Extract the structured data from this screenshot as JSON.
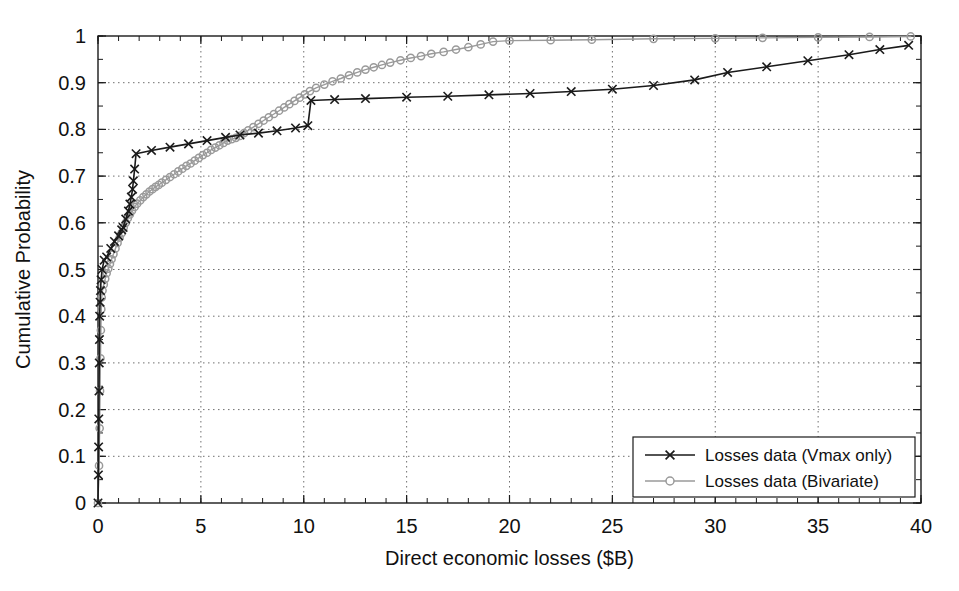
{
  "chart_data": {
    "type": "line",
    "title": "",
    "xlabel": "Direct economic losses ($B)",
    "ylabel": "Cumulative Probability",
    "xlim": [
      0,
      40
    ],
    "ylim": [
      0,
      1
    ],
    "xticks": [
      0,
      5,
      10,
      15,
      20,
      25,
      30,
      35,
      40
    ],
    "xticklabels": [
      "0",
      "5",
      "10",
      "15",
      "20",
      "25",
      "30",
      "35",
      "40"
    ],
    "yticks": [
      0,
      0.1,
      0.2,
      0.3,
      0.4,
      0.5,
      0.6,
      0.7,
      0.8,
      0.9,
      1
    ],
    "yticklabels": [
      "0",
      "0.1",
      "0.2",
      "0.3",
      "0.4",
      "0.5",
      "0.6",
      "0.7",
      "0.8",
      "0.9",
      "1"
    ],
    "xminor_step": 1,
    "yminor_step": 0.05,
    "grid": true,
    "grid_style": "dotted",
    "legend_position": "lower right",
    "series": [
      {
        "name": "Losses data (Vmax only)",
        "color": "#1a1a1a",
        "marker": "x",
        "marker_color": "#1a1a1a",
        "points": [
          [
            0.0,
            0.0
          ],
          [
            0.02,
            0.06
          ],
          [
            0.03,
            0.12
          ],
          [
            0.04,
            0.18
          ],
          [
            0.05,
            0.24
          ],
          [
            0.06,
            0.3
          ],
          [
            0.07,
            0.35
          ],
          [
            0.08,
            0.4
          ],
          [
            0.1,
            0.43
          ],
          [
            0.12,
            0.455
          ],
          [
            0.15,
            0.478
          ],
          [
            0.2,
            0.5
          ],
          [
            0.3,
            0.52
          ],
          [
            0.42,
            0.527
          ],
          [
            0.62,
            0.545
          ],
          [
            0.8,
            0.56
          ],
          [
            1.0,
            0.572
          ],
          [
            1.15,
            0.585
          ],
          [
            1.22,
            0.59
          ],
          [
            1.35,
            0.608
          ],
          [
            1.48,
            0.625
          ],
          [
            1.55,
            0.64
          ],
          [
            1.62,
            0.655
          ],
          [
            1.68,
            0.672
          ],
          [
            1.72,
            0.69
          ],
          [
            1.78,
            0.715
          ],
          [
            1.85,
            0.748
          ],
          [
            2.6,
            0.755
          ],
          [
            3.5,
            0.762
          ],
          [
            4.4,
            0.769
          ],
          [
            5.3,
            0.776
          ],
          [
            6.2,
            0.783
          ],
          [
            6.9,
            0.788
          ],
          [
            7.8,
            0.792
          ],
          [
            8.7,
            0.797
          ],
          [
            9.6,
            0.803
          ],
          [
            10.2,
            0.808
          ],
          [
            10.35,
            0.862
          ],
          [
            11.5,
            0.864
          ],
          [
            13.0,
            0.866
          ],
          [
            15.0,
            0.869
          ],
          [
            17.0,
            0.871
          ],
          [
            19.0,
            0.874
          ],
          [
            21.0,
            0.877
          ],
          [
            23.0,
            0.881
          ],
          [
            25.0,
            0.886
          ],
          [
            27.0,
            0.894
          ],
          [
            29.0,
            0.906
          ],
          [
            30.6,
            0.922
          ],
          [
            32.5,
            0.934
          ],
          [
            34.5,
            0.947
          ],
          [
            36.5,
            0.96
          ],
          [
            38.0,
            0.971
          ],
          [
            39.4,
            0.98
          ]
        ]
      },
      {
        "name": "Losses data (Bivariate)",
        "color": "#9a9a9a",
        "marker": "o",
        "marker_color": "#9a9a9a",
        "points": [
          [
            0.0,
            0.0
          ],
          [
            0.05,
            0.08
          ],
          [
            0.08,
            0.16
          ],
          [
            0.1,
            0.24
          ],
          [
            0.12,
            0.31
          ],
          [
            0.14,
            0.37
          ],
          [
            0.16,
            0.415
          ],
          [
            0.18,
            0.44
          ],
          [
            0.22,
            0.455
          ],
          [
            0.28,
            0.468
          ],
          [
            0.35,
            0.48
          ],
          [
            0.42,
            0.492
          ],
          [
            0.5,
            0.502
          ],
          [
            0.58,
            0.512
          ],
          [
            0.66,
            0.522
          ],
          [
            0.75,
            0.533
          ],
          [
            0.85,
            0.545
          ],
          [
            0.95,
            0.557
          ],
          [
            1.05,
            0.568
          ],
          [
            1.15,
            0.578
          ],
          [
            1.25,
            0.59
          ],
          [
            1.35,
            0.6
          ],
          [
            1.45,
            0.61
          ],
          [
            1.55,
            0.618
          ],
          [
            1.65,
            0.626
          ],
          [
            1.78,
            0.634
          ],
          [
            1.9,
            0.641
          ],
          [
            2.05,
            0.648
          ],
          [
            2.2,
            0.655
          ],
          [
            2.35,
            0.661
          ],
          [
            2.5,
            0.667
          ],
          [
            2.65,
            0.672
          ],
          [
            2.8,
            0.677
          ],
          [
            2.95,
            0.681
          ],
          [
            3.1,
            0.686
          ],
          [
            3.3,
            0.692
          ],
          [
            3.5,
            0.698
          ],
          [
            3.7,
            0.704
          ],
          [
            3.9,
            0.71
          ],
          [
            4.1,
            0.716
          ],
          [
            4.3,
            0.722
          ],
          [
            4.5,
            0.727
          ],
          [
            4.7,
            0.733
          ],
          [
            4.9,
            0.739
          ],
          [
            5.1,
            0.745
          ],
          [
            5.3,
            0.75
          ],
          [
            5.5,
            0.756
          ],
          [
            5.7,
            0.761
          ],
          [
            5.9,
            0.766
          ],
          [
            6.1,
            0.771
          ],
          [
            6.3,
            0.776
          ],
          [
            6.5,
            0.779
          ],
          [
            6.7,
            0.782
          ],
          [
            6.9,
            0.786
          ],
          [
            7.1,
            0.792
          ],
          [
            7.3,
            0.798
          ],
          [
            7.55,
            0.805
          ],
          [
            7.8,
            0.812
          ],
          [
            8.05,
            0.819
          ],
          [
            8.3,
            0.826
          ],
          [
            8.55,
            0.833
          ],
          [
            8.8,
            0.84
          ],
          [
            9.05,
            0.847
          ],
          [
            9.3,
            0.854
          ],
          [
            9.55,
            0.861
          ],
          [
            9.8,
            0.868
          ],
          [
            10.05,
            0.875
          ],
          [
            10.3,
            0.882
          ],
          [
            10.6,
            0.889
          ],
          [
            11.0,
            0.896
          ],
          [
            11.4,
            0.903
          ],
          [
            11.8,
            0.909
          ],
          [
            12.2,
            0.916
          ],
          [
            12.6,
            0.922
          ],
          [
            13.0,
            0.928
          ],
          [
            13.4,
            0.933
          ],
          [
            13.8,
            0.938
          ],
          [
            14.2,
            0.943
          ],
          [
            14.7,
            0.948
          ],
          [
            15.2,
            0.953
          ],
          [
            15.7,
            0.957
          ],
          [
            16.2,
            0.962
          ],
          [
            16.8,
            0.966
          ],
          [
            17.4,
            0.971
          ],
          [
            18.0,
            0.976
          ],
          [
            18.6,
            0.982
          ],
          [
            19.2,
            0.988
          ],
          [
            20.0,
            0.99
          ],
          [
            22.0,
            0.991
          ],
          [
            24.0,
            0.992
          ],
          [
            27.0,
            0.994
          ],
          [
            30.0,
            0.995
          ],
          [
            32.3,
            0.996
          ],
          [
            35.0,
            0.997
          ],
          [
            37.5,
            0.998
          ],
          [
            39.5,
            0.999
          ]
        ]
      }
    ]
  },
  "legend": {
    "entries": [
      {
        "label": "Losses data (Vmax only)"
      },
      {
        "label": "Losses data (Bivariate)"
      }
    ]
  }
}
